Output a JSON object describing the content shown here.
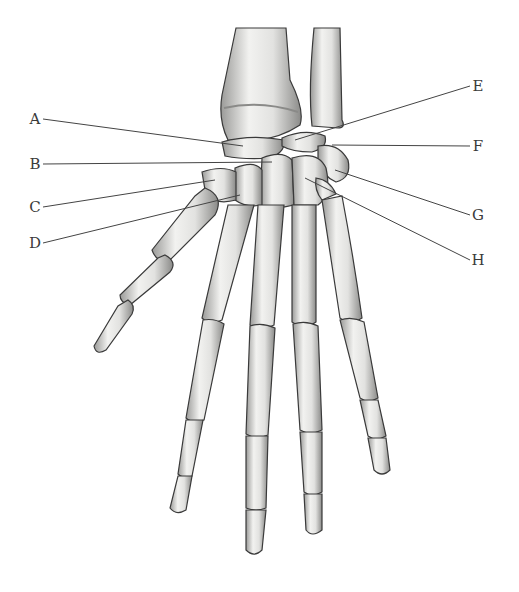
{
  "diagram": {
    "background": "#ffffff",
    "bone_color": "#e6e6e4",
    "bone_shade": "#8c8c8a",
    "outline_color": "#3a3a3a",
    "leader_line_color": "#444444",
    "labels": [
      {
        "id": "A",
        "text": "A",
        "x": 35,
        "y": 119,
        "tx": 243,
        "ty": 146,
        "side": "left"
      },
      {
        "id": "B",
        "text": "B",
        "x": 35,
        "y": 164,
        "tx": 272,
        "ty": 162,
        "side": "left"
      },
      {
        "id": "C",
        "text": "C",
        "x": 35,
        "y": 207,
        "tx": 215,
        "ty": 180,
        "side": "left"
      },
      {
        "id": "D",
        "text": "D",
        "x": 35,
        "y": 243,
        "tx": 240,
        "ty": 195,
        "side": "left"
      },
      {
        "id": "E",
        "text": "E",
        "x": 478,
        "y": 86,
        "tx": 295,
        "ty": 140,
        "side": "right"
      },
      {
        "id": "F",
        "text": "F",
        "x": 478,
        "y": 146,
        "tx": 332,
        "ty": 145,
        "side": "right"
      },
      {
        "id": "G",
        "text": "G",
        "x": 478,
        "y": 215,
        "tx": 335,
        "ty": 170,
        "side": "right"
      },
      {
        "id": "H",
        "text": "H",
        "x": 478,
        "y": 260,
        "tx": 305,
        "ty": 178,
        "side": "right"
      }
    ]
  }
}
